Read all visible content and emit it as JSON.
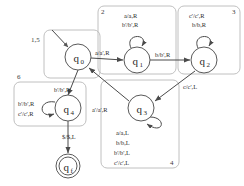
{
  "diagram": {
    "type": "finite-state-machine",
    "colors": {
      "stroke": "#4a4a4a",
      "state_stroke": "#5a5a5a",
      "region_stroke": "#b9b9b9",
      "text": "#2b2b2b",
      "background": "#ffffff"
    },
    "states": [
      {
        "id": "q0",
        "label": "q",
        "sub": "0",
        "cx": 78,
        "cy": 57,
        "r": 13,
        "accepting": false,
        "start": true
      },
      {
        "id": "q1",
        "label": "q",
        "sub": "1",
        "cx": 137,
        "cy": 60,
        "r": 13,
        "accepting": false,
        "start": false
      },
      {
        "id": "q2",
        "label": "q",
        "sub": "2",
        "cx": 204,
        "cy": 60,
        "r": 13,
        "accepting": false,
        "start": false
      },
      {
        "id": "q3",
        "label": "q",
        "sub": "3",
        "cx": 141,
        "cy": 108,
        "r": 13,
        "accepting": false,
        "start": false
      },
      {
        "id": "q4",
        "label": "q",
        "sub": "4",
        "cx": 68,
        "cy": 108,
        "r": 13,
        "accepting": false,
        "start": false
      },
      {
        "id": "qf",
        "label": "q",
        "sub": "f",
        "cx": 68,
        "cy": 166,
        "r": 12,
        "accepting": true,
        "start": false
      }
    ],
    "transitions": [
      {
        "id": "t-start-q0",
        "from": "start",
        "to": "q0",
        "label": ""
      },
      {
        "id": "t-q0-q1",
        "from": "q0",
        "to": "q1",
        "label": "a/a',R"
      },
      {
        "id": "t-q1-q2",
        "from": "q1",
        "to": "q2",
        "label": "b/b',R"
      },
      {
        "id": "t-q2-q3",
        "from": "q2",
        "to": "q3",
        "label": "c/c',L"
      },
      {
        "id": "t-q3-q0",
        "from": "q3",
        "to": "q0",
        "label": "a'/a',R"
      },
      {
        "id": "t-q0-q4",
        "from": "q0",
        "to": "q4",
        "label": "b'/b',R"
      },
      {
        "id": "t-q4-qf",
        "from": "q4",
        "to": "qf",
        "label": "$/$,L"
      }
    ],
    "self_loops": [
      {
        "id": "loop-q1",
        "state": "q1",
        "labels": [
          "a/a,R",
          "b'/b',R"
        ]
      },
      {
        "id": "loop-q2",
        "state": "q2",
        "labels": [
          "c'/c',R",
          "b/b,R"
        ]
      },
      {
        "id": "loop-q3",
        "state": "q3",
        "labels": [
          "a/a,L",
          "b/b,L",
          "b'/b',L",
          "c'/c',L"
        ]
      },
      {
        "id": "loop-q4",
        "state": "q4",
        "labels": [
          "b'/b',R",
          "c'/c',R"
        ]
      }
    ],
    "regions": [
      {
        "id": "region-1-5",
        "number": "1,5"
      },
      {
        "id": "region-2",
        "number": "2"
      },
      {
        "id": "region-3",
        "number": "3"
      },
      {
        "id": "region-4",
        "number": "4"
      },
      {
        "id": "region-6",
        "number": "6"
      }
    ]
  }
}
